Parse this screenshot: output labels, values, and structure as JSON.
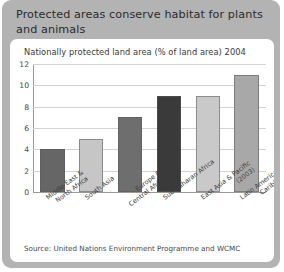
{
  "card": {
    "title": "Protected areas conserve habitat for plants and animals",
    "background_color": "#b3b3b3",
    "panel_color": "#ffffff"
  },
  "source": {
    "text": "Source: United Nations Environment Programme and WCMC"
  },
  "chart_data": {
    "type": "bar",
    "title": "Nationally protected land area (% of land area) 2004",
    "xlabel": "",
    "ylabel": "",
    "ylim": [
      0,
      12
    ],
    "yticks": [
      0,
      2,
      4,
      6,
      8,
      10,
      12
    ],
    "ytick_labels": [
      "0",
      "2",
      "4",
      "6",
      "8",
      "10",
      "12"
    ],
    "grid": true,
    "legend": "none",
    "categories": [
      "Middle East & North Africa",
      "South Asia",
      "Europe & Central Africa",
      "Sub-Saharan Africa",
      "East Asia & Pacific (2003)",
      "Latin America & Caribbean"
    ],
    "category_lines": [
      [
        "Middle East &",
        "North Africa"
      ],
      [
        "South Asia"
      ],
      [
        "Europe &",
        "Central Africa"
      ],
      [
        "Sub-Saharan Africa"
      ],
      [
        "East Asia & Pacific",
        "(2003)"
      ],
      [
        "Latin America &",
        "Caribbean"
      ]
    ],
    "values": [
      4,
      5,
      7,
      9,
      9,
      11
    ],
    "bar_colors": [
      "#666666",
      "#c6c6c6",
      "#6e6e6e",
      "#3a3a3a",
      "#c9c9c9",
      "#a8a8a8"
    ]
  }
}
